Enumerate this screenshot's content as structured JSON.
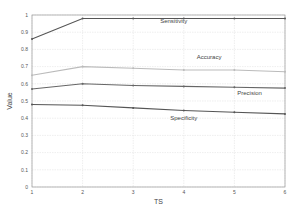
{
  "chart_data": {
    "type": "line",
    "title": "",
    "xlabel": "TS",
    "ylabel": "Value",
    "x": [
      1,
      2,
      3,
      4,
      5,
      6
    ],
    "xticks": [
      "1",
      "2",
      "3",
      "4",
      "5",
      "6"
    ],
    "yticks": [
      "0",
      "0.1",
      "0.2",
      "0.3",
      "0.4",
      "0.5",
      "0.6",
      "0.7",
      "0.8",
      "0.9",
      "1"
    ],
    "ylim": [
      0,
      1
    ],
    "xlim": [
      1,
      6
    ],
    "grid": true,
    "legend": "inline labels",
    "series": [
      {
        "name": "Sensitivity",
        "values": [
          0.86,
          0.98,
          0.98,
          0.98,
          0.98,
          0.98
        ],
        "color": "#555555",
        "label_pos": [
          3.8,
          0.955
        ]
      },
      {
        "name": "Accuracy",
        "values": [
          0.65,
          0.7,
          0.69,
          0.68,
          0.68,
          0.67
        ],
        "color": "#bbbbbb",
        "label_pos": [
          4.5,
          0.745
        ]
      },
      {
        "name": "Precision",
        "values": [
          0.57,
          0.6,
          0.59,
          0.585,
          0.58,
          0.575
        ],
        "color": "#666666",
        "label_pos": [
          5.3,
          0.535
        ]
      },
      {
        "name": "Specificity",
        "values": [
          0.48,
          0.475,
          0.46,
          0.445,
          0.435,
          0.425
        ],
        "color": "#555555",
        "label_pos": [
          4.0,
          0.39
        ]
      }
    ]
  }
}
